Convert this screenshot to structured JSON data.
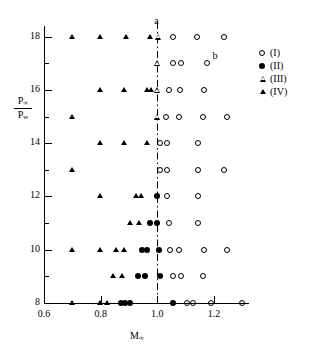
{
  "chart_data": {
    "type": "scatter",
    "title": "",
    "xlabel": "M∞",
    "ylabel": "P∞ / P_w",
    "ylabel_parts": {
      "numerator": "P",
      "numerator_sub": "∞",
      "denominator": "P",
      "denominator_sub": "w"
    },
    "xlim": [
      0.6,
      1.32
    ],
    "ylim": [
      8,
      18.4
    ],
    "xticks": [
      0.6,
      0.8,
      1.0,
      1.2
    ],
    "xtick_labels": [
      "0.6",
      "0.8",
      "1.0",
      "1.2"
    ],
    "yticks": [
      8,
      9,
      10,
      11,
      12,
      13,
      14,
      15,
      16,
      17,
      18
    ],
    "ytick_labels": [
      "8",
      "",
      "10",
      "",
      "12",
      "",
      "14",
      "",
      "16",
      "",
      "18"
    ],
    "ytick_major": [
      8,
      10,
      12,
      14,
      16,
      18
    ],
    "grid": false,
    "legend_position": "right-outside",
    "reference_line": {
      "type": "dash-dot",
      "orientation": "vertical",
      "x": 1.0
    },
    "annotations": [
      {
        "text": "a",
        "x": 1.0,
        "y": 18.55
      },
      {
        "text": "b",
        "x": 1.205,
        "y": 17.25
      }
    ],
    "series": [
      {
        "name": "(I)",
        "label": "(I)",
        "marker": "open-circle",
        "points": [
          [
            1.055,
            18
          ],
          [
            1.14,
            18
          ],
          [
            1.235,
            18
          ],
          [
            1.055,
            17
          ],
          [
            1.085,
            17
          ],
          [
            1.175,
            17
          ],
          [
            1.04,
            16
          ],
          [
            1.08,
            16
          ],
          [
            1.165,
            16
          ],
          [
            1.03,
            15
          ],
          [
            1.075,
            15
          ],
          [
            1.16,
            15
          ],
          [
            1.245,
            15
          ],
          [
            1.01,
            14
          ],
          [
            1.035,
            14
          ],
          [
            1.145,
            14
          ],
          [
            1.01,
            13
          ],
          [
            1.035,
            13
          ],
          [
            1.145,
            13
          ],
          [
            1.235,
            13
          ],
          [
            1.035,
            12
          ],
          [
            1.145,
            12
          ],
          [
            1.04,
            11
          ],
          [
            1.145,
            11
          ],
          [
            1.045,
            10
          ],
          [
            1.075,
            10
          ],
          [
            1.165,
            10
          ],
          [
            1.245,
            10
          ],
          [
            1.055,
            9
          ],
          [
            1.085,
            9
          ],
          [
            1.16,
            9
          ],
          [
            1.105,
            8
          ],
          [
            1.125,
            8
          ],
          [
            1.19,
            8
          ],
          [
            1.3,
            8
          ]
        ]
      },
      {
        "name": "(II)",
        "label": "(II)",
        "marker": "filled-circle",
        "points": [
          [
            1.0,
            12
          ],
          [
            0.975,
            11
          ],
          [
            1.0,
            11
          ],
          [
            0.945,
            10
          ],
          [
            0.965,
            10
          ],
          [
            1.005,
            10
          ],
          [
            0.93,
            9
          ],
          [
            0.955,
            9
          ],
          [
            1.01,
            9
          ],
          [
            0.87,
            8
          ],
          [
            0.885,
            8
          ],
          [
            0.905,
            8
          ],
          [
            1.055,
            8
          ]
        ]
      },
      {
        "name": "(III)",
        "label": "(III)",
        "marker": "open-triangle",
        "points": [
          [
            1.005,
            18
          ],
          [
            1.0,
            17
          ],
          [
            1.0,
            16
          ],
          [
            1.0,
            15
          ]
        ]
      },
      {
        "name": "(IV)",
        "label": "(IV)",
        "marker": "filled-triangle",
        "points": [
          [
            0.7,
            18
          ],
          [
            0.8,
            18
          ],
          [
            0.89,
            18
          ],
          [
            0.975,
            18
          ],
          [
            0.8,
            16
          ],
          [
            0.885,
            16
          ],
          [
            0.965,
            16
          ],
          [
            0.98,
            16
          ],
          [
            0.7,
            15
          ],
          [
            0.8,
            14
          ],
          [
            0.885,
            14
          ],
          [
            0.965,
            14
          ],
          [
            0.7,
            13
          ],
          [
            0.8,
            12
          ],
          [
            0.925,
            12
          ],
          [
            0.945,
            12
          ],
          [
            0.905,
            11
          ],
          [
            0.935,
            11
          ],
          [
            0.7,
            10
          ],
          [
            0.8,
            10
          ],
          [
            0.855,
            10
          ],
          [
            0.885,
            10
          ],
          [
            0.845,
            9
          ],
          [
            0.875,
            9
          ],
          [
            0.7,
            8
          ],
          [
            0.8,
            8
          ],
          [
            0.825,
            8
          ]
        ]
      }
    ]
  },
  "legend": {
    "entries": [
      {
        "symbol": "open-circle-icon",
        "label": "(I)"
      },
      {
        "symbol": "filled-circle-icon",
        "label": "(II)"
      },
      {
        "symbol": "open-triangle-icon",
        "label": "(III)"
      },
      {
        "symbol": "filled-triangle-icon",
        "label": "(IV)"
      }
    ]
  }
}
